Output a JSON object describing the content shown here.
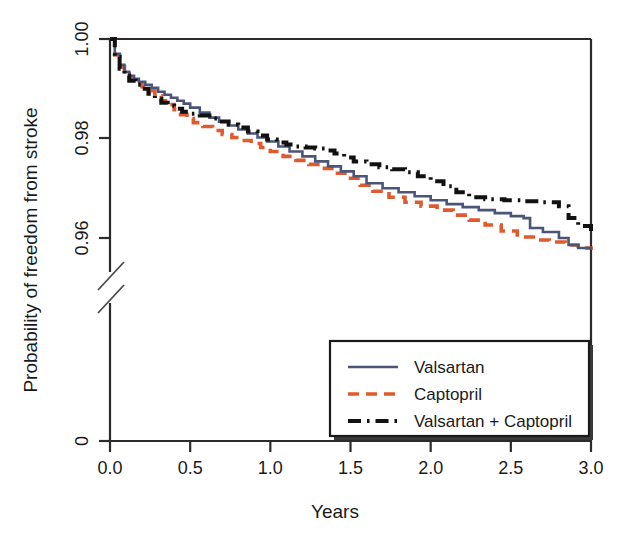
{
  "chart_data": {
    "type": "line",
    "title": "",
    "xlabel": "Years",
    "ylabel": "Probability of freedom from stroke",
    "xlim": [
      0.0,
      3.0
    ],
    "ylim": [
      0.95,
      1.0
    ],
    "xticks": [
      "0.0",
      "0.5",
      "1.0",
      "1.5",
      "2.0",
      "2.5",
      "3.0"
    ],
    "xtick_values": [
      0.0,
      0.5,
      1.0,
      1.5,
      2.0,
      2.5,
      3.0
    ],
    "yticks": [
      "0",
      "0.96",
      "0.98",
      "1.00"
    ],
    "ytick_values": [
      0,
      0.96,
      0.98,
      1.0
    ],
    "axis_break": true,
    "axis_break_note": "Y axis broken between 0 and 0.955",
    "grid": false,
    "legend_position": "bottom-right",
    "series": [
      {
        "name": "Valsartan",
        "color": "#4A5578",
        "style": "solid",
        "x": [
          0.0,
          0.03,
          0.06,
          0.09,
          0.12,
          0.15,
          0.18,
          0.22,
          0.26,
          0.3,
          0.34,
          0.38,
          0.42,
          0.46,
          0.5,
          0.56,
          0.62,
          0.68,
          0.74,
          0.8,
          0.86,
          0.92,
          0.98,
          1.05,
          1.12,
          1.2,
          1.28,
          1.36,
          1.44,
          1.52,
          1.6,
          1.7,
          1.8,
          1.9,
          2.0,
          2.1,
          2.2,
          2.3,
          2.4,
          2.5,
          2.58,
          2.62,
          2.7,
          2.8,
          2.86,
          2.92,
          3.0
        ],
        "y": [
          1.0,
          0.997,
          0.9948,
          0.9934,
          0.9926,
          0.992,
          0.9914,
          0.9908,
          0.9902,
          0.9894,
          0.9888,
          0.9882,
          0.9876,
          0.987,
          0.9862,
          0.9852,
          0.9842,
          0.9834,
          0.9826,
          0.9818,
          0.981,
          0.9802,
          0.9794,
          0.9784,
          0.9774,
          0.9764,
          0.9754,
          0.9744,
          0.9734,
          0.9724,
          0.971,
          0.97,
          0.9692,
          0.9684,
          0.9676,
          0.9668,
          0.9662,
          0.9656,
          0.965,
          0.9644,
          0.964,
          0.962,
          0.9612,
          0.96,
          0.9586,
          0.958,
          0.9576
        ]
      },
      {
        "name": "Captopril",
        "color": "#E05A30",
        "style": "dashed",
        "x": [
          0.0,
          0.03,
          0.06,
          0.09,
          0.12,
          0.16,
          0.2,
          0.24,
          0.28,
          0.32,
          0.36,
          0.4,
          0.44,
          0.48,
          0.52,
          0.58,
          0.64,
          0.7,
          0.76,
          0.82,
          0.88,
          0.94,
          1.0,
          1.08,
          1.16,
          1.24,
          1.32,
          1.4,
          1.48,
          1.56,
          1.64,
          1.74,
          1.84,
          1.94,
          2.04,
          2.14,
          2.24,
          2.34,
          2.44,
          2.54,
          2.64,
          2.74,
          2.84,
          2.92,
          3.0
        ],
        "y": [
          1.0,
          0.9968,
          0.9944,
          0.993,
          0.992,
          0.9912,
          0.9904,
          0.9896,
          0.9886,
          0.9876,
          0.9868,
          0.9858,
          0.9848,
          0.984,
          0.9832,
          0.9824,
          0.9816,
          0.9808,
          0.9802,
          0.9796,
          0.979,
          0.9782,
          0.9774,
          0.9764,
          0.9756,
          0.9748,
          0.974,
          0.973,
          0.972,
          0.9706,
          0.9694,
          0.9682,
          0.9672,
          0.9664,
          0.9656,
          0.9646,
          0.9636,
          0.9626,
          0.9614,
          0.9602,
          0.9596,
          0.9592,
          0.9586,
          0.958,
          0.9576
        ]
      },
      {
        "name": "Valsartan + Captopril",
        "color": "#111111",
        "style": "dashdot",
        "x": [
          0.0,
          0.03,
          0.06,
          0.09,
          0.12,
          0.16,
          0.2,
          0.24,
          0.28,
          0.32,
          0.36,
          0.4,
          0.45,
          0.5,
          0.56,
          0.62,
          0.68,
          0.74,
          0.8,
          0.86,
          0.92,
          0.98,
          1.04,
          1.1,
          1.16,
          1.22,
          1.28,
          1.34,
          1.4,
          1.46,
          1.52,
          1.6,
          1.68,
          1.76,
          1.84,
          1.92,
          2.0,
          2.08,
          2.16,
          2.24,
          2.34,
          2.46,
          2.58,
          2.7,
          2.8,
          2.86,
          2.92,
          3.0
        ],
        "y": [
          1.0,
          0.9964,
          0.994,
          0.9926,
          0.9916,
          0.9908,
          0.99,
          0.989,
          0.988,
          0.9872,
          0.9866,
          0.986,
          0.9854,
          0.985,
          0.9846,
          0.984,
          0.9834,
          0.9828,
          0.9822,
          0.9814,
          0.9806,
          0.9798,
          0.9792,
          0.9788,
          0.9784,
          0.9782,
          0.978,
          0.9776,
          0.977,
          0.9762,
          0.9754,
          0.9748,
          0.9742,
          0.9738,
          0.9732,
          0.9724,
          0.9714,
          0.9704,
          0.9692,
          0.9682,
          0.9678,
          0.9676,
          0.9674,
          0.9672,
          0.9664,
          0.964,
          0.9624,
          0.961
        ]
      }
    ]
  },
  "legend": {
    "items": [
      {
        "label": "Valsartan",
        "color": "#4A5578",
        "style": "solid"
      },
      {
        "label": "Captopril",
        "color": "#E05A30",
        "style": "dashed"
      },
      {
        "label": "Valsartan + Captopril",
        "color": "#111111",
        "style": "dashdot"
      }
    ]
  },
  "axes": {
    "x_title": "Years",
    "y_title": "Probability of freedom from stroke",
    "x_tick_labels": [
      "0.0",
      "0.5",
      "1.0",
      "1.5",
      "2.0",
      "2.5",
      "3.0"
    ],
    "y_tick_labels": [
      "1.00",
      "0.98",
      "0.96",
      "0"
    ]
  }
}
